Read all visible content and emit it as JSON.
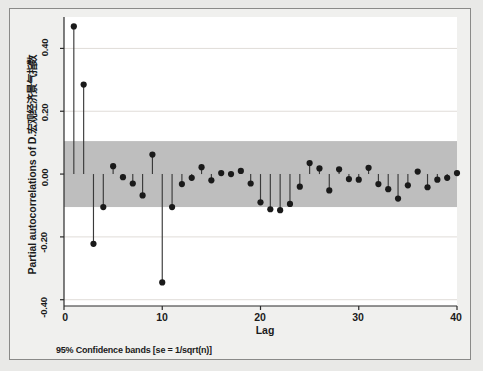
{
  "figure": {
    "background_color": "#f0f0ee",
    "border_color": "#8a8a88",
    "footnote": "95% Confidence bands [se = 1/sqrt(n)]"
  },
  "chart_data": {
    "type": "scatter",
    "title": "",
    "subtitle": "",
    "ylabel": "Partial autocorrelations of D.宏观经济景气指数",
    "xlabel": "Lag",
    "xlim": [
      0,
      40
    ],
    "ylim": [
      -0.42,
      0.5
    ],
    "xticks": [
      0,
      10,
      20,
      30,
      40
    ],
    "xtick_labels": [
      "0",
      "10",
      "20",
      "30",
      "40"
    ],
    "yticks": [
      0.4,
      0.2,
      0.0,
      -0.2,
      -0.4
    ],
    "ytick_labels": [
      "0.40",
      "0.20",
      "0.00",
      "-0.20",
      "-0.40"
    ],
    "grid": true,
    "grid_color": "#e0dcd8",
    "legend": "none",
    "marker_color": "#1a1a1a",
    "stem_color": "#3a3a3a",
    "confidence_band": {
      "label": "95% Confidence bands [se = 1/sqrt(n)]",
      "upper": 0.105,
      "lower": -0.105,
      "color": "#b8b8b8"
    },
    "x": [
      1,
      2,
      3,
      4,
      5,
      6,
      7,
      8,
      9,
      10,
      11,
      12,
      13,
      14,
      15,
      16,
      17,
      18,
      19,
      20,
      21,
      22,
      23,
      24,
      25,
      26,
      27,
      28,
      29,
      30,
      31,
      32,
      33,
      34,
      35,
      36,
      37,
      38,
      39,
      40
    ],
    "values": [
      0.47,
      0.285,
      -0.222,
      -0.105,
      0.025,
      -0.01,
      -0.03,
      -0.068,
      0.062,
      -0.345,
      -0.105,
      -0.032,
      -0.012,
      0.022,
      -0.02,
      0.003,
      0.0,
      0.01,
      -0.03,
      -0.09,
      -0.112,
      -0.115,
      -0.095,
      -0.04,
      0.035,
      0.018,
      -0.052,
      0.015,
      -0.016,
      -0.018,
      0.02,
      -0.032,
      -0.048,
      -0.078,
      -0.036,
      0.008,
      -0.042,
      -0.018,
      -0.012,
      0.003
    ],
    "series": [
      {
        "name": "Partial autocorrelation",
        "values": [
          0.47,
          0.285,
          -0.222,
          -0.105,
          0.025,
          -0.01,
          -0.03,
          -0.068,
          0.062,
          -0.345,
          -0.105,
          -0.032,
          -0.012,
          0.022,
          -0.02,
          0.003,
          0.0,
          0.01,
          -0.03,
          -0.09,
          -0.112,
          -0.115,
          -0.095,
          -0.04,
          0.035,
          0.018,
          -0.052,
          0.015,
          -0.016,
          -0.018,
          0.02,
          -0.032,
          -0.048,
          -0.078,
          -0.036,
          0.008,
          -0.042,
          -0.018,
          -0.012,
          0.003
        ]
      }
    ]
  }
}
